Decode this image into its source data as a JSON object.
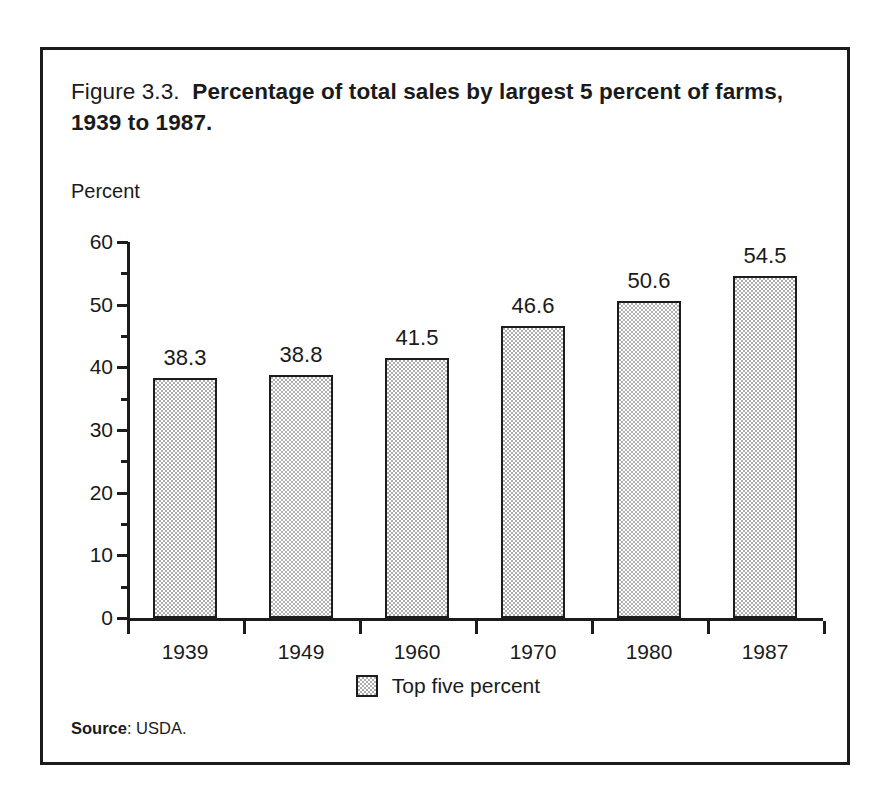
{
  "figure": {
    "number": "Figure 3.3.",
    "caption": "Percentage of total sales by largest 5 percent of farms, 1939 to 1987.",
    "source_label": "Source",
    "source_text": ": USDA."
  },
  "chart_data": {
    "type": "bar",
    "title": "Percentage of total sales by largest 5 percent of farms, 1939 to 1987.",
    "xlabel": "",
    "ylabel": "Percent",
    "categories": [
      "1939",
      "1949",
      "1960",
      "1970",
      "1980",
      "1987"
    ],
    "values": [
      38.3,
      38.8,
      41.5,
      46.6,
      50.6,
      54.5
    ],
    "value_labels": [
      "38.3",
      "38.8",
      "41.5",
      "46.6",
      "50.6",
      "54.5"
    ],
    "series": [
      {
        "name": "Top five percent",
        "values": [
          38.3,
          38.8,
          41.5,
          46.6,
          50.6,
          54.5
        ]
      }
    ],
    "ylim": [
      0,
      60
    ],
    "y_major_ticks": [
      0,
      10,
      20,
      30,
      40,
      50,
      60
    ],
    "y_tick_labels": [
      "0",
      "10",
      "20",
      "30",
      "40",
      "50",
      "60"
    ],
    "y_minor_ticks": [
      5,
      15,
      25,
      35,
      45,
      55
    ],
    "grid": false,
    "legend": [
      "Top five percent"
    ],
    "legend_position": "bottom-center",
    "bar_fill_color": "#adadad",
    "bar_edge_color": "#1c1c1c"
  }
}
